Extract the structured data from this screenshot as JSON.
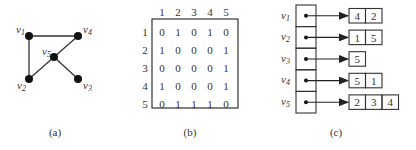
{
  "figure": {
    "panels": [
      {
        "id": "a",
        "caption": "(a)"
      },
      {
        "id": "b",
        "caption": "(b)"
      },
      {
        "id": "c",
        "caption": "(c)"
      }
    ]
  },
  "graph": {
    "vertices": [
      {
        "name": "v1",
        "base": "v",
        "sub": "1"
      },
      {
        "name": "v2",
        "base": "v",
        "sub": "2"
      },
      {
        "name": "v3",
        "base": "v",
        "sub": "3"
      },
      {
        "name": "v4",
        "base": "v",
        "sub": "4"
      },
      {
        "name": "v5",
        "base": "v",
        "sub": "5"
      }
    ],
    "edges": [
      [
        "v1",
        "v4"
      ],
      [
        "v1",
        "v2"
      ],
      [
        "v2",
        "v5"
      ],
      [
        "v5",
        "v4"
      ],
      [
        "v5",
        "v3"
      ]
    ]
  },
  "matrix": {
    "col_headers": [
      "1",
      "2",
      "3",
      "4",
      "5"
    ],
    "row_headers": [
      "1",
      "2",
      "3",
      "4",
      "5"
    ],
    "rows": [
      [
        "0",
        "1",
        "0",
        "1",
        "0"
      ],
      [
        "1",
        "0",
        "0",
        "0",
        "1"
      ],
      [
        "0",
        "0",
        "0",
        "0",
        "1"
      ],
      [
        "1",
        "0",
        "0",
        "0",
        "1"
      ],
      [
        "0",
        "1",
        "1",
        "1",
        "0"
      ]
    ]
  },
  "adjacency_lists": [
    {
      "base": "v",
      "sub": "1",
      "neighbors": [
        "4",
        "2"
      ]
    },
    {
      "base": "v",
      "sub": "2",
      "neighbors": [
        "1",
        "5"
      ]
    },
    {
      "base": "v",
      "sub": "3",
      "neighbors": [
        "5"
      ]
    },
    {
      "base": "v",
      "sub": "4",
      "neighbors": [
        "5",
        "1"
      ]
    },
    {
      "base": "v",
      "sub": "5",
      "neighbors": [
        "2",
        "3",
        "4"
      ]
    }
  ]
}
